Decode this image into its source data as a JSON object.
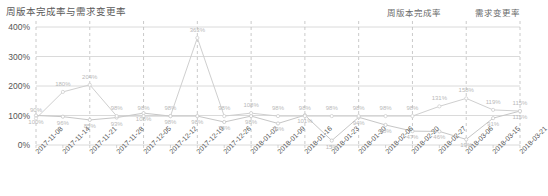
{
  "chart_data": {
    "type": "line",
    "title": "周版本完成率与需求变更率",
    "xlabel": "",
    "ylabel": "",
    "ylim": [
      0,
      400
    ],
    "yticks": [
      "0%",
      "100%",
      "200%",
      "300%",
      "400%"
    ],
    "grid": true,
    "legend_position": "top-right",
    "categories": [
      "2017-11-08",
      "2017-11-14",
      "2017-11-21",
      "2017-11-28",
      "2017-12-05",
      "2017-12-12",
      "2017-12-19",
      "2017-12-26",
      "2018-01-02",
      "2018-01-09",
      "2018-01-16",
      "2018-01-23",
      "2018-01-30",
      "2018-02-06",
      "2018-02-20",
      "2018-02-27",
      "2018-03-06",
      "2018-03-15",
      "2018-03-21"
    ],
    "series": [
      {
        "name": "周版本完成率",
        "color": "#c6c6c6",
        "values": [
          100,
          96,
          85,
          93,
          108,
          98,
          98,
          78,
          98,
          73,
          101,
          15,
          94,
          68,
          47,
          46,
          19,
          91,
          115
        ],
        "labels": [
          "100%",
          "96%",
          "85%",
          "93%",
          "108%",
          "98%",
          "98%",
          "78%",
          "98%",
          "73%",
          "101%",
          "15%",
          "94%",
          "68%",
          "47%",
          "46%",
          "19%",
          "91%",
          "115%"
        ]
      },
      {
        "name": "需求变更率",
        "color": "#cfcfcf",
        "values": [
          90,
          180,
          204,
          98,
          98,
          98,
          363,
          98,
          108,
          98,
          98,
          98,
          98,
          98,
          98,
          131,
          158,
          119,
          115
        ],
        "labels": [
          "90%",
          "180%",
          "204%",
          "98%",
          "98%",
          "98%",
          "363%",
          "98%",
          "108%",
          "98%",
          "98%",
          "98%",
          "98%",
          "98%",
          "98%",
          "131%",
          "158%",
          "119%",
          "115%"
        ]
      }
    ]
  },
  "legend": {
    "entries": [
      {
        "label": "周版本完成率"
      },
      {
        "label": "需求变更率"
      }
    ]
  }
}
